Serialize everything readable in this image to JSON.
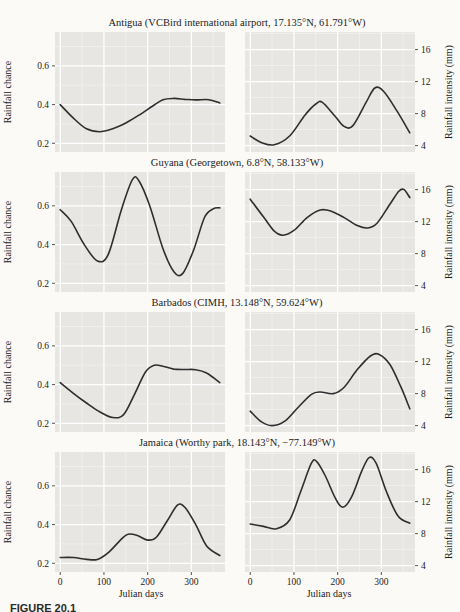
{
  "figure": {
    "caption": "FIGURE 20.1",
    "xlabel": "Julian days",
    "left_ylabel": "Rainfall chance",
    "right_ylabel": "Rainfall intensity (mm)",
    "rows": [
      {
        "title": "Antigua (VCBird international airport, 17.135°N, 61.791°W)"
      },
      {
        "title": "Guyana (Georgetown, 6.8°N, 58.133°W)"
      },
      {
        "title": "Barbados (CIMH, 13.148°N, 59.624°W)"
      },
      {
        "title": "Jamaica (Worthy park, 18.143°N, −77.149°W)"
      }
    ]
  },
  "colors": {
    "page_bg": "#fbfaf7",
    "panel_bg": "#e7e6e3",
    "grid_major": "#ffffff",
    "grid_minor": "#f2f1ee",
    "curve": "#2e2e2e",
    "text": "#1b1b1b",
    "tick": "#555555"
  },
  "chart_data": [
    {
      "type": "line",
      "location": "Antigua",
      "measure": "Rainfall chance",
      "ylabel": "Rainfall chance",
      "axis_side": "left",
      "show_xticks": false,
      "xlim": [
        -12,
        377
      ],
      "ylim": [
        0.155,
        0.775
      ],
      "xticks": [
        0,
        100,
        200,
        300
      ],
      "xtick_labels": [
        "0",
        "100",
        "200",
        "300"
      ],
      "ytick_values": [
        0.2,
        0.4,
        0.6
      ],
      "ytick_labels": [
        "0.2",
        "0.4",
        "0.6"
      ],
      "grid_x": [
        0,
        50,
        100,
        150,
        200,
        250,
        300,
        350
      ],
      "grid_y": [
        0.2,
        0.3,
        0.4,
        0.5,
        0.6,
        0.7
      ],
      "x": [
        0,
        30,
        60,
        90,
        120,
        150,
        180,
        210,
        235,
        260,
        285,
        310,
        340,
        365
      ],
      "y": [
        0.4,
        0.33,
        0.275,
        0.26,
        0.275,
        0.305,
        0.345,
        0.39,
        0.425,
        0.432,
        0.427,
        0.424,
        0.425,
        0.408
      ]
    },
    {
      "type": "line",
      "location": "Antigua",
      "measure": "Rainfall intensity (mm)",
      "ylabel": "Rainfall intensity (mm)",
      "axis_side": "right",
      "show_xticks": false,
      "xlim": [
        -12,
        377
      ],
      "ylim": [
        3.2,
        18.2
      ],
      "xticks": [
        0,
        100,
        200,
        300
      ],
      "xtick_labels": [
        "0",
        "100",
        "200",
        "300"
      ],
      "ytick_values": [
        4,
        8,
        12,
        16
      ],
      "ytick_labels": [
        "4",
        "8",
        "12",
        "16"
      ],
      "grid_x": [
        0,
        50,
        100,
        150,
        200,
        250,
        300,
        350
      ],
      "grid_y": [
        4,
        6,
        8,
        10,
        12,
        14,
        16,
        18
      ],
      "x": [
        0,
        25,
        55,
        90,
        125,
        150,
        165,
        195,
        215,
        235,
        265,
        285,
        305,
        335,
        365
      ],
      "y": [
        5.2,
        4.4,
        4.1,
        5.2,
        7.8,
        9.2,
        9.4,
        7.6,
        6.4,
        6.5,
        9.4,
        11.2,
        10.8,
        8.4,
        5.6
      ]
    },
    {
      "type": "line",
      "location": "Guyana",
      "measure": "Rainfall chance",
      "ylabel": "Rainfall chance",
      "axis_side": "left",
      "show_xticks": false,
      "xlim": [
        -12,
        377
      ],
      "ylim": [
        0.155,
        0.775
      ],
      "xticks": [
        0,
        100,
        200,
        300
      ],
      "xtick_labels": [
        "0",
        "100",
        "200",
        "300"
      ],
      "ytick_values": [
        0.2,
        0.4,
        0.6
      ],
      "ytick_labels": [
        "0.2",
        "0.4",
        "0.6"
      ],
      "grid_x": [
        0,
        50,
        100,
        150,
        200,
        250,
        300,
        350
      ],
      "grid_y": [
        0.2,
        0.3,
        0.4,
        0.5,
        0.6,
        0.7
      ],
      "x": [
        0,
        25,
        55,
        85,
        110,
        140,
        165,
        180,
        205,
        235,
        260,
        280,
        305,
        330,
        350,
        365
      ],
      "y": [
        0.58,
        0.52,
        0.4,
        0.315,
        0.35,
        0.58,
        0.735,
        0.73,
        0.6,
        0.38,
        0.26,
        0.25,
        0.37,
        0.54,
        0.585,
        0.59
      ]
    },
    {
      "type": "line",
      "location": "Guyana",
      "measure": "Rainfall intensity (mm)",
      "ylabel": "Rainfall intensity (mm)",
      "axis_side": "right",
      "show_xticks": false,
      "xlim": [
        -12,
        377
      ],
      "ylim": [
        3.2,
        18.2
      ],
      "xticks": [
        0,
        100,
        200,
        300
      ],
      "xtick_labels": [
        "0",
        "100",
        "200",
        "300"
      ],
      "ytick_values": [
        4,
        8,
        12,
        16
      ],
      "ytick_labels": [
        "4",
        "8",
        "12",
        "16"
      ],
      "grid_x": [
        0,
        50,
        100,
        150,
        200,
        250,
        300,
        350
      ],
      "grid_y": [
        4,
        6,
        8,
        10,
        12,
        14,
        16,
        18
      ],
      "x": [
        0,
        30,
        55,
        75,
        100,
        130,
        160,
        185,
        215,
        245,
        268,
        290,
        320,
        340,
        352,
        365
      ],
      "y": [
        14.8,
        12.6,
        10.8,
        10.3,
        10.9,
        12.5,
        13.45,
        13.3,
        12.5,
        11.5,
        11.2,
        11.8,
        14.2,
        15.8,
        16.0,
        15.0
      ]
    },
    {
      "type": "line",
      "location": "Barbados",
      "measure": "Rainfall chance",
      "ylabel": "Rainfall chance",
      "axis_side": "left",
      "show_xticks": false,
      "xlim": [
        -12,
        377
      ],
      "ylim": [
        0.155,
        0.775
      ],
      "xticks": [
        0,
        100,
        200,
        300
      ],
      "xtick_labels": [
        "0",
        "100",
        "200",
        "300"
      ],
      "ytick_values": [
        0.2,
        0.4,
        0.6
      ],
      "ytick_labels": [
        "0.2",
        "0.4",
        "0.6"
      ],
      "grid_x": [
        0,
        50,
        100,
        150,
        200,
        250,
        300,
        350
      ],
      "grid_y": [
        0.2,
        0.3,
        0.4,
        0.5,
        0.6,
        0.7
      ],
      "x": [
        0,
        30,
        60,
        90,
        120,
        145,
        170,
        195,
        215,
        235,
        260,
        285,
        310,
        335,
        365
      ],
      "y": [
        0.41,
        0.355,
        0.305,
        0.26,
        0.23,
        0.245,
        0.35,
        0.465,
        0.5,
        0.495,
        0.48,
        0.478,
        0.477,
        0.46,
        0.41
      ]
    },
    {
      "type": "line",
      "location": "Barbados",
      "measure": "Rainfall intensity (mm)",
      "ylabel": "Rainfall intensity (mm)",
      "axis_side": "right",
      "show_xticks": false,
      "xlim": [
        -12,
        377
      ],
      "ylim": [
        3.2,
        18.2
      ],
      "xticks": [
        0,
        100,
        200,
        300
      ],
      "xtick_labels": [
        "0",
        "100",
        "200",
        "300"
      ],
      "ytick_values": [
        4,
        8,
        12,
        16
      ],
      "ytick_labels": [
        "4",
        "8",
        "12",
        "16"
      ],
      "grid_x": [
        0,
        50,
        100,
        150,
        200,
        250,
        300,
        350
      ],
      "grid_y": [
        4,
        6,
        8,
        10,
        12,
        14,
        16,
        18
      ],
      "x": [
        0,
        25,
        50,
        80,
        110,
        140,
        160,
        190,
        215,
        245,
        275,
        295,
        320,
        345,
        365
      ],
      "y": [
        5.8,
        4.5,
        4.0,
        4.6,
        6.3,
        7.9,
        8.2,
        8.0,
        8.8,
        11.0,
        12.7,
        12.9,
        11.6,
        8.8,
        6.1
      ]
    },
    {
      "type": "line",
      "location": "Jamaica",
      "measure": "Rainfall chance",
      "ylabel": "Rainfall chance",
      "axis_side": "left",
      "show_xticks": true,
      "xlim": [
        -12,
        377
      ],
      "ylim": [
        0.155,
        0.775
      ],
      "xticks": [
        0,
        100,
        200,
        300
      ],
      "xtick_labels": [
        "0",
        "100",
        "200",
        "300"
      ],
      "ytick_values": [
        0.2,
        0.4,
        0.6
      ],
      "ytick_labels": [
        "0.2",
        "0.4",
        "0.6"
      ],
      "grid_x": [
        0,
        50,
        100,
        150,
        200,
        250,
        300,
        350
      ],
      "grid_y": [
        0.2,
        0.3,
        0.4,
        0.5,
        0.6,
        0.7
      ],
      "x": [
        0,
        30,
        60,
        85,
        110,
        140,
        155,
        175,
        200,
        220,
        245,
        268,
        285,
        310,
        335,
        365
      ],
      "y": [
        0.23,
        0.23,
        0.22,
        0.22,
        0.255,
        0.325,
        0.35,
        0.345,
        0.32,
        0.335,
        0.42,
        0.5,
        0.49,
        0.4,
        0.29,
        0.24
      ]
    },
    {
      "type": "line",
      "location": "Jamaica",
      "measure": "Rainfall intensity (mm)",
      "ylabel": "Rainfall intensity (mm)",
      "axis_side": "right",
      "show_xticks": true,
      "xlim": [
        -12,
        377
      ],
      "ylim": [
        3.2,
        18.2
      ],
      "xticks": [
        0,
        100,
        200,
        300
      ],
      "xtick_labels": [
        "0",
        "100",
        "200",
        "300"
      ],
      "ytick_values": [
        4,
        8,
        12,
        16
      ],
      "ytick_labels": [
        "4",
        "8",
        "12",
        "16"
      ],
      "grid_x": [
        0,
        50,
        100,
        150,
        200,
        250,
        300,
        350
      ],
      "grid_y": [
        4,
        6,
        8,
        10,
        12,
        14,
        16,
        18
      ],
      "x": [
        0,
        30,
        60,
        90,
        115,
        140,
        152,
        172,
        195,
        212,
        232,
        255,
        272,
        288,
        312,
        338,
        365
      ],
      "y": [
        9.2,
        8.9,
        8.6,
        9.7,
        13.2,
        16.8,
        17.0,
        15.2,
        12.4,
        11.3,
        12.6,
        15.8,
        17.5,
        16.8,
        13.2,
        10.2,
        9.3
      ]
    }
  ]
}
